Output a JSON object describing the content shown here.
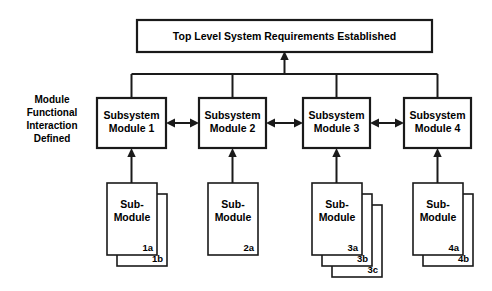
{
  "diagram": {
    "title_box": {
      "label": "Top Level System Requirements Established"
    },
    "side_label": {
      "line1": "Module",
      "line2": "Functional",
      "line3": "Interaction",
      "line4": "Defined"
    },
    "modules": [
      {
        "line1": "Subsystem",
        "line2": "Module 1"
      },
      {
        "line1": "Subsystem",
        "line2": "Module 2"
      },
      {
        "line1": "Subsystem",
        "line2": "Module 3"
      },
      {
        "line1": "Subsystem",
        "line2": "Module 4"
      }
    ],
    "submodules": [
      {
        "line1": "Sub-",
        "line2": "Module",
        "tags": [
          "1a",
          "1b"
        ]
      },
      {
        "line1": "Sub-",
        "line2": "Module",
        "tags": [
          "2a"
        ]
      },
      {
        "line1": "Sub-",
        "line2": "Module",
        "tags": [
          "3a",
          "3b",
          "3c"
        ]
      },
      {
        "line1": "Sub-",
        "line2": "Module",
        "tags": [
          "4a",
          "4b"
        ]
      }
    ],
    "colors": {
      "line": "#1a1a1a",
      "fill": "#ffffff",
      "text": "#000000"
    }
  }
}
